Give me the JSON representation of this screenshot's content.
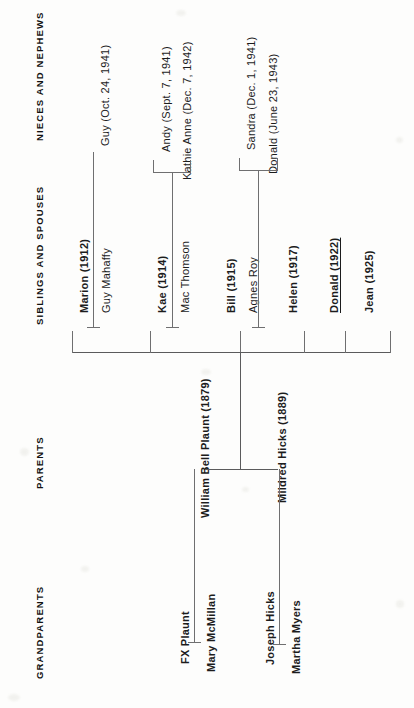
{
  "document": {
    "type": "family-tree-chart",
    "orientation": "text-rotated-90-ccw",
    "background_color": "#fdfdfc",
    "line_color": "#6f6f70"
  },
  "columns": [
    {
      "id": "grandparents",
      "label": "GRANDPARENTS"
    },
    {
      "id": "parents",
      "label": "PARENTS"
    },
    {
      "id": "siblings",
      "label": "SIBLINGS AND SPOUSES"
    },
    {
      "id": "nieces",
      "label": "NIECES AND NEPHEWS"
    }
  ],
  "generations": {
    "grandparents": [
      {
        "name": "FX Plaunt",
        "bold": true,
        "underline": false
      },
      {
        "name": "Mary McMillan",
        "bold": true,
        "underline": false
      },
      {
        "name": "Joseph Hicks",
        "bold": true,
        "underline": false
      },
      {
        "name": "Martha Myers",
        "bold": true,
        "underline": false
      }
    ],
    "parents": [
      {
        "name": "William Bell Plaunt (1879)",
        "bold": true,
        "underline": false
      },
      {
        "name": "Mildred Hicks (1889)",
        "bold": true,
        "underline": false
      }
    ],
    "siblings_and_spouses": [
      {
        "name": "Marion (1912)",
        "bold": true,
        "underline": false,
        "role": "sibling"
      },
      {
        "name": "Guy Mahaffy",
        "bold": false,
        "underline": false,
        "role": "spouse"
      },
      {
        "name": "Kae (1914)",
        "bold": true,
        "underline": false,
        "role": "sibling"
      },
      {
        "name": "Mac Thomson",
        "bold": false,
        "underline": false,
        "role": "spouse"
      },
      {
        "name": "Bill (1915)",
        "bold": true,
        "underline": false,
        "role": "sibling"
      },
      {
        "name": "Agnes Roy",
        "bold": false,
        "underline": false,
        "role": "spouse"
      },
      {
        "name": "Helen (1917)",
        "bold": true,
        "underline": false,
        "role": "sibling"
      },
      {
        "name": "Donald (1922)",
        "bold": true,
        "underline": true,
        "role": "sibling"
      },
      {
        "name": "Jean (1925)",
        "bold": true,
        "underline": false,
        "role": "sibling"
      }
    ],
    "nieces_and_nephews": [
      {
        "name": "Guy (Oct. 24, 1941)",
        "parents": "Marion & Guy Mahaffy"
      },
      {
        "name": "Andy (Sept. 7, 1941)",
        "parents": "Kae & Mac Thomson"
      },
      {
        "name": "Kathie Anne (Dec. 7, 1942)",
        "parents": "Kae & Mac Thomson"
      },
      {
        "name": "Sandra (Dec. 1, 1941)",
        "parents": "Bill & Agnes Roy"
      },
      {
        "name": "Donald (June 23, 1943)",
        "parents": "Bill & Agnes Roy"
      }
    ]
  }
}
